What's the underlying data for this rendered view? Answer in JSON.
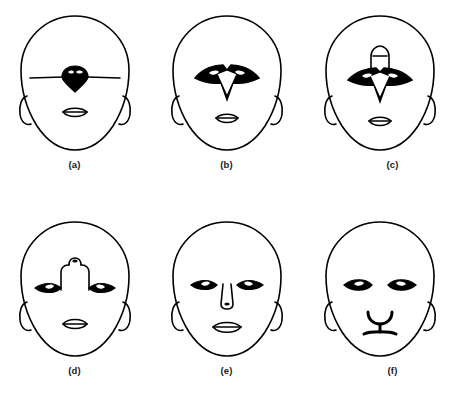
{
  "figure": {
    "background_color": "#ffffff",
    "ink_color": "#000000",
    "layout": {
      "columns": 3,
      "rows": 2
    },
    "panels": [
      {
        "id": "a",
        "label": "(a)",
        "icon_name": "face-diagram-a",
        "description": "Egg-shaped head with long horizontal brow line crossing a dark diamond-shaped nose; small lens-shaped mouth; two elongated ears",
        "features": {
          "head": "oval",
          "eyes": "single horizontal line through center",
          "nose": "dark filled diamond on brow line",
          "mouth": "lens with horizontal line",
          "ears": "two elongated ovals"
        }
      },
      {
        "id": "b",
        "label": "(b)",
        "icon_name": "face-diagram-b",
        "description": "Head with two dark triangular eyes joined to a downward-pointing white V nose; small lens-shaped mouth",
        "features": {
          "head": "oval",
          "eyes": "two dark wedge eyes merged with nose",
          "nose": "white downward V between eyes",
          "mouth": "lens with horizontal line",
          "ears": "two elongated ovals"
        }
      },
      {
        "id": "c",
        "label": "(c)",
        "icon_name": "face-diagram-c",
        "description": "Head as in (b) with an added arch / hat-like bridge shape above the merged eye-nose unit",
        "features": {
          "head": "oval",
          "eyes": "two dark wedge eyes merged with nose",
          "nose": "white downward V with arch bridge above",
          "mouth": "lens with horizontal line",
          "ears": "two elongated ovals"
        }
      },
      {
        "id": "d",
        "label": "(d)",
        "icon_name": "face-diagram-d",
        "description": "Head with two separate dark almond eyes linked by a raised nose bridge topped by a small notch; small lens-shaped mouth",
        "features": {
          "head": "oval",
          "eyes": "two dark almond eyes",
          "nose": "raised bridge with small square notch",
          "mouth": "lens with horizontal line",
          "ears": "two elongated ovals"
        }
      },
      {
        "id": "e",
        "label": "(e)",
        "icon_name": "face-diagram-e",
        "description": "Head with two separate dark almond eyes with white highlights, an outlined nose below, and lens-shaped mouth",
        "features": {
          "head": "oval",
          "eyes": "two dark almond eyes with white pupil highlights",
          "nose": "outlined nose with nostril below eyes",
          "mouth": "lens with horizontal line",
          "ears": "two elongated ovals"
        }
      },
      {
        "id": "f",
        "label": "(f)",
        "icon_name": "face-diagram-f",
        "description": "Head with two separate dark almond eyes and a Y-shaped cat-like nose and mouth combined",
        "features": {
          "head": "oval",
          "eyes": "two dark almond eyes with white pupil highlights",
          "nose": "Y-shaped nose joined to mouth bar",
          "mouth": "horizontal bar at base of Y",
          "ears": "two elongated ovals"
        }
      }
    ]
  }
}
